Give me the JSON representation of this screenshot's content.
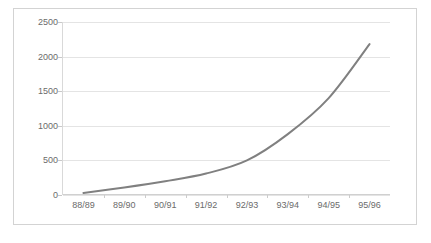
{
  "chart_data": {
    "type": "line",
    "title": "",
    "subtitle": "",
    "xlabel": "",
    "ylabel": "",
    "categories": [
      "88/89",
      "89/90",
      "90/91",
      "91/92",
      "92/93",
      "93/94",
      "94/95",
      "95/96"
    ],
    "series": [
      {
        "name": "",
        "values": [
          30,
          110,
          200,
          310,
          500,
          880,
          1400,
          2180
        ],
        "color": "#808080"
      }
    ],
    "ylim": [
      0,
      2500
    ],
    "y_ticks": [
      0,
      500,
      1000,
      1500,
      2000,
      2500
    ],
    "y_tick_labels": [
      "0",
      "500",
      "1000",
      "1500",
      "2000",
      "2500"
    ],
    "grid": true,
    "grid_axis": "y",
    "legend": false,
    "legend_position": "none",
    "markers": false,
    "line_width_px": 2,
    "plot_background": "#ffffff",
    "grid_color": "#e4e4e4",
    "axis_color": "#d0d0d0",
    "tick_label_color": "#6b6b6b",
    "border_color": "#d3d3d3"
  }
}
